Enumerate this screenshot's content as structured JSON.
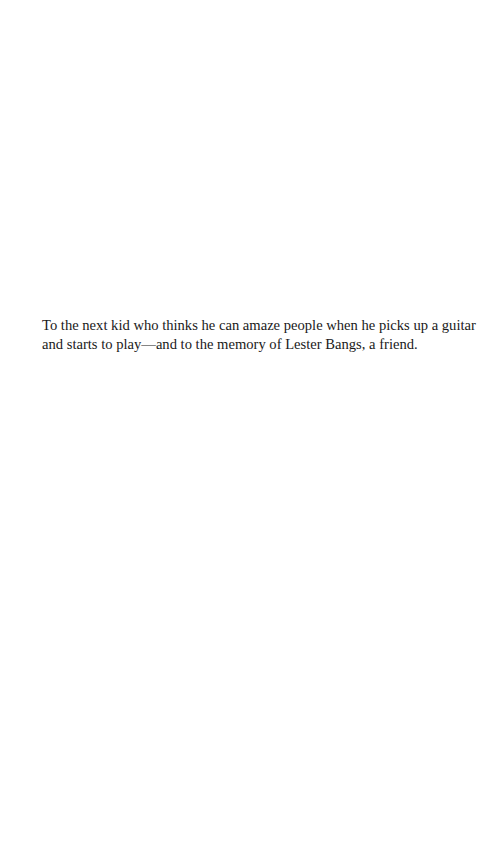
{
  "page": {
    "background": "#ffffff",
    "text_color": "#1a1a1a"
  },
  "dedication": {
    "lines": [
      "To the next kid who thinks he can amaze people when he picks up a guitar",
      "and starts to play—and to the memory of Lester Bangs, a friend."
    ]
  }
}
